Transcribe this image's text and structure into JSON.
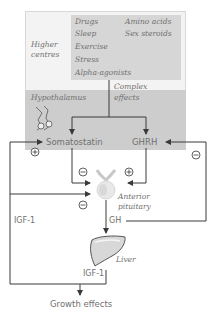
{
  "higher_centres": {
    "label_line1": "Higher",
    "label_line2": "centres",
    "factors_left": [
      "Drugs",
      "Sleep",
      "Exercise",
      "Stress",
      "Alpha-agonists"
    ],
    "factors_right": [
      "Amino acids",
      "Sex steroids"
    ],
    "effect_line1": "Complex",
    "effect_line2": "effects"
  },
  "hypothalamus": {
    "label": "Hypothalamus",
    "icon": "hypothalamus-icon",
    "somatostatin": "Somatostatin",
    "ghrh": "GHRH"
  },
  "pituitary": {
    "label_line1": "Anterior",
    "label_line2": "pituitary",
    "icon": "pituitary-gland-icon"
  },
  "signals": {
    "gh": "GH",
    "igf1_left": "IGF-1",
    "igf1_liver": "IGF-1"
  },
  "liver": {
    "label": "Liver",
    "icon": "liver-icon"
  },
  "output": "Growth effects",
  "signs": {
    "plus": "+",
    "minus": "−"
  },
  "colors": {
    "line": "#3a3a3a",
    "box_light": "#f3f3f3",
    "box_gray": "#d6d6d6",
    "band_gray": "#cdcdcd"
  }
}
